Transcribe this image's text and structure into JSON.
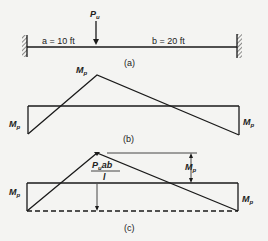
{
  "figure": {
    "part_a": {
      "caption": "(a)",
      "load_label": "P",
      "load_subscript": "u",
      "span_a_label": "a = 10 ft",
      "span_b_label": "b = 20 ft",
      "supports": [
        "fixed-left",
        "fixed-right"
      ]
    },
    "part_b": {
      "caption": "(b)",
      "peak_label": "M",
      "peak_subscript": "p",
      "left_label": "M",
      "left_subscript": "p",
      "right_label": "M",
      "right_subscript": "p"
    },
    "part_c": {
      "caption": "(c)",
      "fraction_numerator": "P",
      "fraction_numerator_subscript": "u",
      "fraction_numerator_rest": "ab",
      "fraction_denominator": "l",
      "dimension_label": "M",
      "dimension_subscript": "p",
      "left_label": "M",
      "left_subscript": "p",
      "right_label": "M",
      "right_subscript": "p"
    }
  }
}
